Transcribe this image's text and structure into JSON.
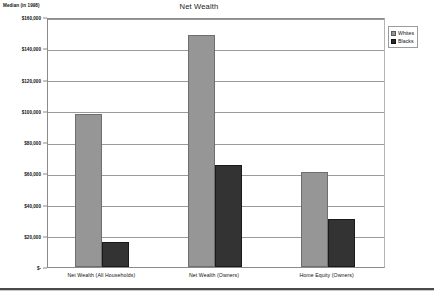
{
  "chart_data": {
    "type": "bar",
    "title": "Net Wealth",
    "axis_caption": "Median (in 1998)",
    "xlabel": "",
    "ylabel": "",
    "categories": [
      "Net Wealth  (All Households)",
      "Net Wealth  (Owners)",
      "Home Equity  (Owners)"
    ],
    "series": [
      {
        "name": "Whites",
        "color": "#969696",
        "values": [
          98000,
          148500,
          60500
        ]
      },
      {
        "name": "Blacks",
        "color": "#333333",
        "values": [
          16000,
          65000,
          31000
        ]
      }
    ],
    "ylim": [
      0,
      160000
    ],
    "ytick_values": [
      0,
      20000,
      40000,
      60000,
      80000,
      100000,
      120000,
      140000,
      160000
    ],
    "ytick_labels": [
      "$-",
      "$20,000",
      "$40,000",
      "$60,000",
      "$80,000",
      "$100,000",
      "$120,000",
      "$140,000",
      "$160,000"
    ],
    "grid": true,
    "legend_position": "top-right",
    "legend_entries": [
      "Whites",
      "Blacks"
    ]
  }
}
